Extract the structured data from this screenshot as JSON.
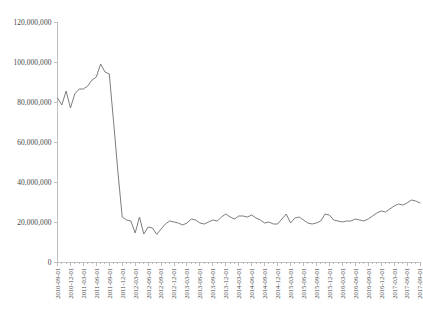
{
  "chart_data": {
    "type": "line",
    "title": "",
    "subtitle": "",
    "xlabel": "",
    "ylabel": "",
    "grid": false,
    "legend": "none",
    "ylim": [
      0,
      120000000
    ],
    "ytick_labels": [
      "120,000,000",
      "100,000,000",
      "80,000,000",
      "60,000,000",
      "40,000,000",
      "20,000,000",
      "0"
    ],
    "ytick_values": [
      120000000,
      100000000,
      80000000,
      60000000,
      40000000,
      20000000,
      0
    ],
    "xtick_labels": [
      "2010-09-01",
      "2010-12-01",
      "2011-03-01",
      "2011-06-01",
      "2011-09-01",
      "2011-12-01",
      "2012-03-01",
      "2012-06-01",
      "2012-09-01",
      "2012-12-01",
      "2013-03-01",
      "2013-06-01",
      "2013-09-01",
      "2013-12-01",
      "2014-03-01",
      "2014-06-01",
      "2014-09-01",
      "2014-12-01",
      "2015-03-01",
      "2015-06-01",
      "2015-09-01",
      "2015-12-01",
      "2016-03-01",
      "2016-06-01",
      "2016-09-01",
      "2016-12-01",
      "2017-03-01",
      "2017-06-01",
      "2017-09-01"
    ],
    "x": [
      "2010-09-01",
      "2010-10-01",
      "2010-11-01",
      "2010-12-01",
      "2011-01-01",
      "2011-02-01",
      "2011-03-01",
      "2011-04-01",
      "2011-05-01",
      "2011-06-01",
      "2011-07-01",
      "2011-08-01",
      "2011-09-01",
      "2011-10-01",
      "2011-11-01",
      "2011-12-01",
      "2012-01-01",
      "2012-02-01",
      "2012-03-01",
      "2012-04-01",
      "2012-05-01",
      "2012-06-01",
      "2012-07-01",
      "2012-08-01",
      "2012-09-01",
      "2012-10-01",
      "2012-11-01",
      "2012-12-01",
      "2013-01-01",
      "2013-02-01",
      "2013-03-01",
      "2013-04-01",
      "2013-05-01",
      "2013-06-01",
      "2013-07-01",
      "2013-08-01",
      "2013-09-01",
      "2013-10-01",
      "2013-11-01",
      "2013-12-01",
      "2014-01-01",
      "2014-02-01",
      "2014-03-01",
      "2014-04-01",
      "2014-05-01",
      "2014-06-01",
      "2014-07-01",
      "2014-08-01",
      "2014-09-01",
      "2014-10-01",
      "2014-11-01",
      "2014-12-01",
      "2015-01-01",
      "2015-02-01",
      "2015-03-01",
      "2015-04-01",
      "2015-05-01",
      "2015-06-01",
      "2015-07-01",
      "2015-08-01",
      "2015-09-01",
      "2015-10-01",
      "2015-11-01",
      "2015-12-01",
      "2016-01-01",
      "2016-02-01",
      "2016-03-01",
      "2016-04-01",
      "2016-05-01",
      "2016-06-01",
      "2016-07-01",
      "2016-08-01",
      "2016-09-01",
      "2016-10-01",
      "2016-11-01",
      "2016-12-01",
      "2017-01-01",
      "2017-02-01",
      "2017-03-01",
      "2017-04-01",
      "2017-05-01",
      "2017-06-01",
      "2017-07-01",
      "2017-08-01",
      "2017-09-01"
    ],
    "values": [
      82000000,
      78500000,
      85500000,
      77000000,
      84000000,
      86500000,
      86500000,
      88000000,
      91000000,
      92500000,
      99000000,
      95000000,
      94000000,
      70000000,
      45000000,
      22500000,
      21000000,
      20500000,
      14500000,
      22500000,
      14000000,
      17500000,
      17000000,
      13800000,
      16500000,
      19000000,
      20500000,
      20000000,
      19500000,
      18500000,
      19500000,
      21500000,
      21000000,
      19500000,
      19000000,
      20000000,
      21000000,
      20500000,
      22500000,
      24000000,
      22500000,
      21500000,
      23000000,
      23000000,
      22500000,
      23500000,
      22000000,
      21000000,
      19500000,
      20000000,
      19000000,
      19000000,
      21500000,
      24000000,
      19500000,
      22000000,
      22500000,
      21000000,
      19500000,
      19000000,
      19500000,
      20500000,
      24000000,
      23500000,
      21000000,
      20500000,
      20000000,
      20500000,
      20500000,
      21500000,
      21000000,
      20500000,
      21500000,
      23000000,
      24500000,
      25500000,
      25000000,
      26500000,
      28000000,
      29000000,
      28500000,
      29500000,
      31000000,
      30500000,
      29500000
    ]
  },
  "axes": {
    "y_axis_name": "y-axis",
    "x_axis_name": "x-axis"
  },
  "style": {
    "line_color": "#7d7d7d",
    "axis_color": "#b9b9b9",
    "text_color": "#3f3f3f",
    "background": "#ffffff"
  }
}
